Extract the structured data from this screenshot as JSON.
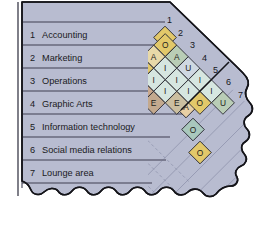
{
  "departments": [
    {
      "num": "1",
      "name": "Accounting"
    },
    {
      "num": "2",
      "name": "Marketing"
    },
    {
      "num": "3",
      "name": "Operations"
    },
    {
      "num": "4",
      "name": "Graphic Arts"
    },
    {
      "num": "5",
      "name": "Information technology"
    },
    {
      "num": "6",
      "name": "Social media relations"
    },
    {
      "num": "7",
      "name": "Lounge area"
    }
  ],
  "diagonal_numbers": [
    "1",
    "2",
    "3",
    "4",
    "5",
    "6",
    "7"
  ],
  "chart_data": {
    "type": "table",
    "xlabel": "",
    "ylabel": "",
    "rating_codes": [
      "A",
      "E",
      "I",
      "O",
      "U"
    ],
    "grid": "diamond-lattice-45deg",
    "pairs": [
      {
        "from": "1",
        "to": "2",
        "rating": "O"
      },
      {
        "from": "1",
        "to": "3",
        "rating": "A"
      },
      {
        "from": "1",
        "to": "4",
        "rating": "O"
      },
      {
        "from": "1",
        "to": "5",
        "rating": "A"
      },
      {
        "from": "1",
        "to": "6",
        "rating": "O"
      },
      {
        "from": "1",
        "to": "7",
        "rating": "O"
      },
      {
        "from": "2",
        "to": "3",
        "rating": "A"
      },
      {
        "from": "2",
        "to": "4",
        "rating": "I"
      },
      {
        "from": "2",
        "to": "5",
        "rating": "I"
      },
      {
        "from": "2",
        "to": "6",
        "rating": "A"
      },
      {
        "from": "2",
        "to": "7",
        "rating": "U"
      },
      {
        "from": "3",
        "to": "4",
        "rating": "U"
      },
      {
        "from": "3",
        "to": "5",
        "rating": "I"
      },
      {
        "from": "3",
        "to": "6",
        "rating": "I"
      },
      {
        "from": "3",
        "to": "7",
        "rating": "E"
      },
      {
        "from": "4",
        "to": "5",
        "rating": "I"
      },
      {
        "from": "4",
        "to": "6",
        "rating": "I"
      },
      {
        "from": "4",
        "to": "7",
        "rating": "E"
      },
      {
        "from": "5",
        "to": "6",
        "rating": "I"
      },
      {
        "from": "5",
        "to": "7",
        "rating": "O"
      },
      {
        "from": "6",
        "to": "7",
        "rating": "U"
      }
    ],
    "colors": {
      "A": "#b9cdb6",
      "E": "#c3a98e",
      "I": "#cfe0dc",
      "O": "#e2c86a",
      "U": "#b2c9a9",
      "paper": "#b8bcd0",
      "outline": "#1a1a1a",
      "rule": "#3b3b4a"
    }
  },
  "cells": [
    {
      "col": 1,
      "row": 1,
      "letter": "O",
      "fill": "#e2c86a"
    },
    {
      "col": 1,
      "row": 2,
      "letter": "A",
      "fill": "#e8d9a8"
    },
    {
      "col": 1,
      "row": 3,
      "letter": "O",
      "fill": "#e2c86a"
    },
    {
      "col": 1,
      "row": 4,
      "letter": "A",
      "fill": "#e8cfa4"
    },
    {
      "col": 1,
      "row": 5,
      "letter": "O",
      "fill": "#a9c8bd"
    },
    {
      "col": 1,
      "row": 6,
      "letter": "O",
      "fill": "#e2c86a"
    },
    {
      "col": 2,
      "row": 1,
      "letter": "A",
      "fill": "#b9cdb6"
    },
    {
      "col": 2,
      "row": 2,
      "letter": "I",
      "fill": "#d6e6e0"
    },
    {
      "col": 2,
      "row": 3,
      "letter": "I",
      "fill": "#d6e6e0"
    },
    {
      "col": 2,
      "row": 4,
      "letter": "A",
      "fill": "#c9a98e"
    },
    {
      "col": 2,
      "row": 5,
      "letter": "U",
      "fill": "#e2c86a"
    },
    {
      "col": 3,
      "row": 1,
      "letter": "U",
      "fill": "#cfd8e2"
    },
    {
      "col": 3,
      "row": 2,
      "letter": "I",
      "fill": "#d6e6e0"
    },
    {
      "col": 3,
      "row": 3,
      "letter": "I",
      "fill": "#d6e6e0"
    },
    {
      "col": 3,
      "row": 4,
      "letter": "E",
      "fill": "#c3a98e"
    },
    {
      "col": 4,
      "row": 1,
      "letter": "I",
      "fill": "#d6e6e0"
    },
    {
      "col": 4,
      "row": 2,
      "letter": "I",
      "fill": "#d6e6e0"
    },
    {
      "col": 4,
      "row": 3,
      "letter": "E",
      "fill": "#cbbfa0"
    },
    {
      "col": 5,
      "row": 1,
      "letter": "I",
      "fill": "#d6e6e0"
    },
    {
      "col": 5,
      "row": 2,
      "letter": "O",
      "fill": "#e2c86a"
    },
    {
      "col": 6,
      "row": 1,
      "letter": "U",
      "fill": "#b9cdb6"
    }
  ]
}
